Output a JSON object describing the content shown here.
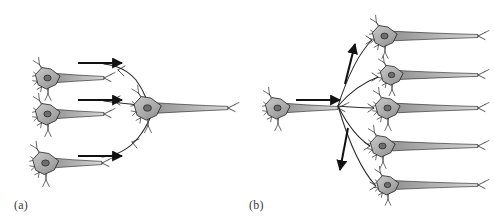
{
  "figure": {
    "background_color": "#ffffff",
    "width": 495,
    "height": 224,
    "style": "pen-and-ink scientific illustration"
  },
  "panels": [
    {
      "id": "a",
      "label": "(a)",
      "label_x": 14,
      "label_y": 198,
      "concept": "convergence",
      "input_neuron_count": 3,
      "output_neuron_count": 1,
      "arrow_count": 3,
      "arrow_direction": "right"
    },
    {
      "id": "b",
      "label": "(b)",
      "label_x": 249,
      "label_y": 198,
      "concept": "divergence",
      "input_neuron_count": 1,
      "output_neuron_count": 5,
      "arrow_count": 3,
      "arrow_direction": "right, up-right, down-right"
    }
  ],
  "colors": {
    "soma_fill": "#a9a9a9",
    "soma_fill_light": "#c4c4c4",
    "nucleus_fill": "#6e6e6e",
    "outline": "#2b2b2b",
    "axon_fill": "#9a9a9a",
    "arrow": "#111111",
    "label_text": "#3a3a3a",
    "background": "#ffffff"
  },
  "neurons": {
    "panel_a_inputs": [
      {
        "name": "input-neuron-top",
        "x": 48,
        "y": 78,
        "scale": 1.0
      },
      {
        "name": "input-neuron-middle",
        "x": 48,
        "y": 114,
        "scale": 1.0
      },
      {
        "name": "input-neuron-bottom",
        "x": 46,
        "y": 163,
        "scale": 1.05
      }
    ],
    "panel_a_output": [
      {
        "name": "output-neuron-converged",
        "x": 148,
        "y": 108,
        "scale": 1.1
      }
    ],
    "panel_b_input": [
      {
        "name": "source-neuron",
        "x": 278,
        "y": 108,
        "scale": 1.0
      }
    ],
    "panel_b_outputs": [
      {
        "name": "target-neuron-1",
        "x": 385,
        "y": 36,
        "scale": 1.0
      },
      {
        "name": "target-neuron-2",
        "x": 392,
        "y": 75,
        "scale": 0.92
      },
      {
        "name": "target-neuron-3",
        "x": 388,
        "y": 108,
        "scale": 1.0
      },
      {
        "name": "target-neuron-4",
        "x": 383,
        "y": 146,
        "scale": 1.0
      },
      {
        "name": "target-neuron-5",
        "x": 388,
        "y": 185,
        "scale": 0.9
      }
    ]
  },
  "arrows": {
    "panel_a": [
      {
        "name": "flow-arrow-top",
        "x1": 78,
        "y1": 63,
        "x2": 122,
        "y2": 63
      },
      {
        "name": "flow-arrow-middle",
        "x1": 78,
        "y1": 100,
        "x2": 122,
        "y2": 100
      },
      {
        "name": "flow-arrow-bottom",
        "x1": 78,
        "y1": 156,
        "x2": 122,
        "y2": 156
      }
    ],
    "panel_b": [
      {
        "name": "flow-arrow-source",
        "x1": 296,
        "y1": 100,
        "x2": 340,
        "y2": 100
      },
      {
        "name": "flow-arrow-up",
        "x1": 345,
        "y1": 84,
        "x2": 355,
        "y2": 44
      },
      {
        "name": "flow-arrow-down",
        "x1": 348,
        "y1": 128,
        "x2": 340,
        "y2": 170
      }
    ]
  }
}
